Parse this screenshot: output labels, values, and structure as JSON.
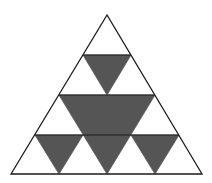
{
  "diagram": {
    "type": "sierpinski-triangle",
    "iteration_level": 2,
    "colors": {
      "background": "#ffffff",
      "outline": "#1a1a1a",
      "fill": "#555555"
    },
    "outer_triangle": {
      "points": [
        [
          107,
          15
        ],
        [
          11,
          174
        ],
        [
          202,
          174
        ]
      ],
      "stroke_width": 1.3
    },
    "shaded_triangles": [
      {
        "name": "center-large",
        "points": [
          [
            59,
            95
          ],
          [
            155,
            95
          ],
          [
            107,
            174
          ]
        ]
      },
      {
        "name": "top-small",
        "points": [
          [
            83,
            55
          ],
          [
            131,
            55
          ],
          [
            107,
            95
          ]
        ]
      },
      {
        "name": "bottom-left-small",
        "points": [
          [
            35,
            135
          ],
          [
            83,
            135
          ],
          [
            59,
            174
          ]
        ]
      },
      {
        "name": "bottom-right-small",
        "points": [
          [
            131,
            135
          ],
          [
            179,
            135
          ],
          [
            155,
            174
          ]
        ]
      }
    ],
    "inner_lines": [
      {
        "name": "row-line-1",
        "from": [
          83,
          55
        ],
        "to": [
          131,
          55
        ]
      },
      {
        "name": "row-line-2",
        "from": [
          59,
          95
        ],
        "to": [
          155,
          95
        ]
      },
      {
        "name": "row-line-3",
        "from": [
          35,
          135
        ],
        "to": [
          179,
          135
        ]
      }
    ]
  }
}
